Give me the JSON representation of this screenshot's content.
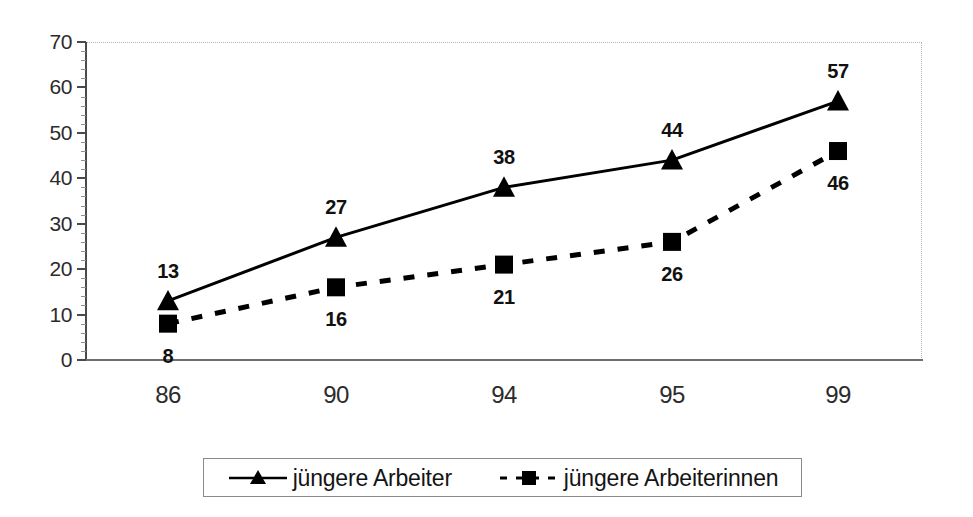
{
  "chart_data": {
    "type": "line",
    "title": "",
    "xlabel": "",
    "ylabel": "",
    "categories": [
      "86",
      "90",
      "94",
      "95",
      "99"
    ],
    "ylim": [
      0,
      70
    ],
    "y_ticks": [
      "0",
      "10",
      "20",
      "30",
      "40",
      "50",
      "60",
      "70"
    ],
    "grid": false,
    "legend_position": "bottom",
    "series": [
      {
        "name": "jüngere Arbeiter",
        "values": [
          13,
          27,
          38,
          44,
          57
        ],
        "labels": [
          "13",
          "27",
          "38",
          "44",
          "57"
        ],
        "line_style": "solid",
        "marker": "triangle",
        "color": "#000000",
        "label_position": "above"
      },
      {
        "name": "jüngere Arbeiterinnen",
        "values": [
          8,
          16,
          21,
          26,
          46
        ],
        "labels": [
          "8",
          "16",
          "21",
          "26",
          "46"
        ],
        "line_style": "dashed",
        "marker": "square",
        "color": "#000000",
        "label_position": "below"
      }
    ]
  },
  "legend": {
    "entries": [
      {
        "label": "jüngere Arbeiter",
        "marker": "triangle-marker",
        "line_style": "solid"
      },
      {
        "label": "jüngere Arbeiterinnen",
        "marker": "square-marker",
        "line_style": "dashed"
      }
    ]
  },
  "colors": {
    "series": "#000000",
    "axis": "#4a4a4a",
    "border": "#b5b5b5",
    "background": "#ffffff"
  }
}
